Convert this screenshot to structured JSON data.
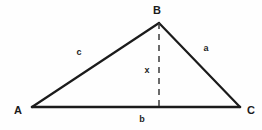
{
  "diagram": {
    "type": "triangle-with-altitude",
    "background_color": "#fefefe",
    "stroke_color": "#1b1b1b",
    "dashed_stroke_color": "#3a3a3a",
    "vertices": [
      {
        "name": "A",
        "label": "A",
        "point_x": 32,
        "point_y": 107,
        "label_x": 18,
        "label_y": 110
      },
      {
        "name": "B",
        "label": "B",
        "point_x": 159,
        "point_y": 23,
        "label_x": 157,
        "label_y": 10
      },
      {
        "name": "C",
        "label": "C",
        "point_x": 240,
        "point_y": 107,
        "label_x": 251,
        "label_y": 110
      }
    ],
    "sides": [
      {
        "name": "side-c",
        "label": "c",
        "from": "A",
        "to": "B",
        "label_x": 79,
        "label_y": 52
      },
      {
        "name": "side-a",
        "label": "a",
        "from": "B",
        "to": "C",
        "label_x": 206,
        "label_y": 48
      },
      {
        "name": "side-b",
        "label": "b",
        "from": "A",
        "to": "C",
        "label_x": 142,
        "label_y": 119
      }
    ],
    "altitude": {
      "name": "altitude-x",
      "label": "x",
      "from_x": 159,
      "from_y": 23,
      "to_x": 159,
      "to_y": 107,
      "label_x": 147,
      "label_y": 70,
      "dash_pattern": "6,5"
    }
  }
}
